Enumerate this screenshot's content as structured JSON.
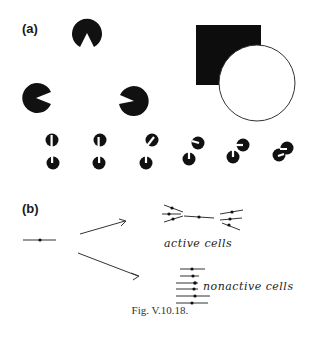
{
  "figure": {
    "caption": "Fig. V.10.18.",
    "panel_a": {
      "label": "(a)",
      "kanizsa_triangle": {
        "inducers": [
          {
            "cx": 87,
            "cy": 33,
            "r": 15,
            "mouth_dir_deg": 90
          },
          {
            "cx": 36,
            "cy": 98,
            "r": 15,
            "mouth_dir_deg": -20
          },
          {
            "cx": 134,
            "cy": 101,
            "r": 15,
            "mouth_dir_deg": 200
          }
        ]
      },
      "occlusion": {
        "square": {
          "x": 196,
          "y": 25,
          "w": 65,
          "h": 60
        },
        "circle": {
          "cx": 257,
          "cy": 83,
          "r": 38
        }
      },
      "small_pacmen_pairs": 6
    },
    "panel_b": {
      "label": "(b)",
      "active_label": "active cells",
      "nonactive_label": "nonactive cells"
    }
  }
}
